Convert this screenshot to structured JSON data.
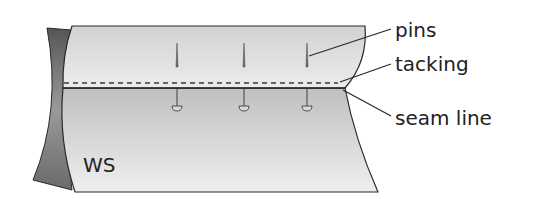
{
  "diagram": {
    "fabric_label": "WS",
    "labels": {
      "pins": "pins",
      "tacking": "tacking",
      "seam_line": "seam line"
    },
    "colors": {
      "fabric_light": "#e6e6e6",
      "fabric_shade": "#bdbdbd",
      "flap_dark": "#6f6f6f",
      "outline": "#2a2a2a",
      "text": "#222222"
    },
    "pin_count": 3
  }
}
